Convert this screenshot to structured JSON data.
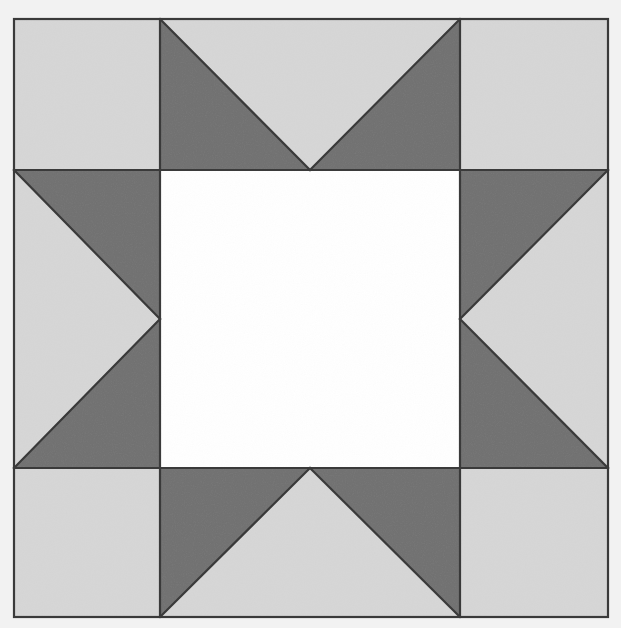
{
  "image": {
    "title": "Sawtooth Star Quilt Block",
    "description": "Nine-patch star quilt block photographed flat on a light background",
    "width": 621,
    "height": 628,
    "background_color": "#f2f2f2"
  },
  "palette": {
    "light_fabric": "#d6d6d6",
    "dark_fabric": "#707070",
    "center_fabric": "#ffffff",
    "seam_line": "#3a3a3a",
    "backdrop": "#f2f2f2"
  },
  "block": {
    "name": "sawtooth-star",
    "bounds": {
      "x": 14,
      "y": 19,
      "width": 594,
      "height": 598
    },
    "seam_width": 2.2,
    "grid": {
      "columns": [
        14,
        160,
        460,
        608
      ],
      "rows": [
        19,
        170,
        468,
        617
      ]
    }
  },
  "units": [
    {
      "name": "corner-top-left",
      "type": "plain-square",
      "row": 0,
      "col": 0,
      "rect": {
        "x": 14,
        "y": 19,
        "width": 146,
        "height": 151
      },
      "fill": "light_fabric"
    },
    {
      "name": "point-top",
      "type": "flying-geese",
      "row": 0,
      "col": 1,
      "rect": {
        "x": 160,
        "y": 19,
        "width": 300,
        "height": 151
      },
      "goose_direction": "down",
      "goose_fill": "light_fabric",
      "wing_fill": "dark_fabric"
    },
    {
      "name": "corner-top-right",
      "type": "plain-square",
      "row": 0,
      "col": 2,
      "rect": {
        "x": 460,
        "y": 19,
        "width": 148,
        "height": 151
      },
      "fill": "light_fabric"
    },
    {
      "name": "point-left",
      "type": "flying-geese",
      "row": 1,
      "col": 0,
      "rect": {
        "x": 14,
        "y": 170,
        "width": 146,
        "height": 298
      },
      "goose_direction": "right",
      "goose_fill": "light_fabric",
      "wing_fill": "dark_fabric"
    },
    {
      "name": "center-square",
      "type": "plain-square",
      "row": 1,
      "col": 1,
      "rect": {
        "x": 160,
        "y": 170,
        "width": 300,
        "height": 298
      },
      "fill": "center_fabric"
    },
    {
      "name": "point-right",
      "type": "flying-geese",
      "row": 1,
      "col": 2,
      "rect": {
        "x": 460,
        "y": 170,
        "width": 148,
        "height": 298
      },
      "goose_direction": "left",
      "goose_fill": "light_fabric",
      "wing_fill": "dark_fabric"
    },
    {
      "name": "corner-bottom-left",
      "type": "plain-square",
      "row": 2,
      "col": 0,
      "rect": {
        "x": 14,
        "y": 468,
        "width": 146,
        "height": 149
      },
      "fill": "light_fabric"
    },
    {
      "name": "point-bottom",
      "type": "flying-geese",
      "row": 2,
      "col": 1,
      "rect": {
        "x": 160,
        "y": 468,
        "width": 300,
        "height": 149
      },
      "goose_direction": "up",
      "goose_fill": "light_fabric",
      "wing_fill": "dark_fabric"
    },
    {
      "name": "corner-bottom-right",
      "type": "plain-square",
      "row": 2,
      "col": 2,
      "rect": {
        "x": 460,
        "y": 468,
        "width": 148,
        "height": 149
      },
      "fill": "light_fabric"
    }
  ]
}
